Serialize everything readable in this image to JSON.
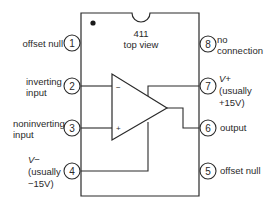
{
  "chip": {
    "part_number": "411",
    "view_label": "top view"
  },
  "op_amp": {
    "inverting_sign": "−",
    "noninverting_sign": "+"
  },
  "pins": [
    {
      "number": "1",
      "side": "left",
      "label_lines": [
        "offset null"
      ]
    },
    {
      "number": "2",
      "side": "left",
      "label_lines": [
        "inverting",
        "input"
      ]
    },
    {
      "number": "3",
      "side": "left",
      "label_lines": [
        "noninverting",
        "input"
      ]
    },
    {
      "number": "4",
      "side": "left",
      "label_lines": [
        "V−",
        "(usually",
        "−15V)"
      ]
    },
    {
      "number": "8",
      "side": "right",
      "label_lines": [
        "no",
        "connection"
      ]
    },
    {
      "number": "7",
      "side": "right",
      "label_lines": [
        "V+",
        "(usually",
        "+15V)"
      ]
    },
    {
      "number": "6",
      "side": "right",
      "label_lines": [
        "output"
      ]
    },
    {
      "number": "5",
      "side": "right",
      "label_lines": [
        "offset null"
      ]
    }
  ],
  "colors": {
    "line": "#2a2a2a",
    "background": "#ffffff"
  }
}
